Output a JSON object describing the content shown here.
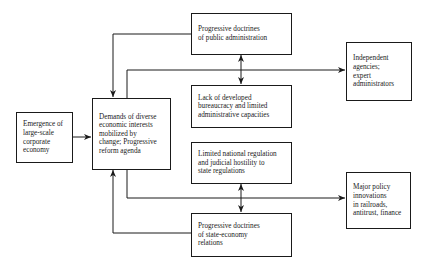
{
  "diagram": {
    "type": "flowchart",
    "nodes": [
      {
        "id": "emergence",
        "text": "Emergence of\nlarge-scale\ncorporate\neconomy"
      },
      {
        "id": "demands",
        "text": "Demands of diverse\neconomic interests\nmobilized by\nchange; Progressive\nreform agenda"
      },
      {
        "id": "prog_public_admin",
        "text": "Progressive doctrines\nof public administration"
      },
      {
        "id": "lack_bureaucracy",
        "text": "Lack of developed\nbureaucracy and limited\nadministrative capacities"
      },
      {
        "id": "independent_agencies",
        "text": "Independent\nagencies;\nexpert\nadministrators"
      },
      {
        "id": "limited_regulation",
        "text": "Limited national regulation\nand judicial hostility to\nstate regulations"
      },
      {
        "id": "prog_state_economy",
        "text": "Progressive doctrines\nof state-economy\nrelations"
      },
      {
        "id": "major_policy",
        "text": "Major policy\ninnovations\nin railroads,\nantitrust, finance"
      }
    ],
    "edges": [
      {
        "from": "emergence",
        "to": "demands",
        "type": "arrow"
      },
      {
        "from": "prog_public_admin",
        "to": "demands",
        "type": "arrow"
      },
      {
        "from": "demands",
        "to": "independent_agencies",
        "type": "arrow"
      },
      {
        "from": "prog_public_admin",
        "to": "lack_bureaucracy",
        "type": "double-arrow"
      },
      {
        "from": "demands",
        "to": "major_policy",
        "type": "arrow"
      },
      {
        "from": "limited_regulation",
        "to": "prog_state_economy",
        "type": "double-arrow"
      },
      {
        "from": "prog_state_economy",
        "to": "demands",
        "type": "arrow"
      }
    ]
  },
  "colors": {
    "line": "#1a1a1a",
    "background": "#ffffff"
  }
}
